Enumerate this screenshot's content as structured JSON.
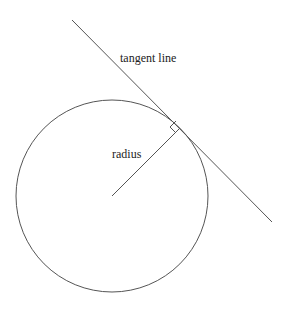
{
  "diagram": {
    "labels": {
      "tangent": "tangent line",
      "radius": "radius"
    },
    "colors": {
      "stroke": "#555555",
      "text": "#222222",
      "background": "#ffffff"
    },
    "circle": {
      "cx": 112,
      "cy": 196,
      "r": 96
    },
    "tangent_line": {
      "x1": 72,
      "y1": 20,
      "x2": 272,
      "y2": 222
    },
    "radius_line": {
      "x1": 112,
      "y1": 196,
      "x2": 180,
      "y2": 128
    },
    "right_angle_marker": "square at point of tangency"
  }
}
